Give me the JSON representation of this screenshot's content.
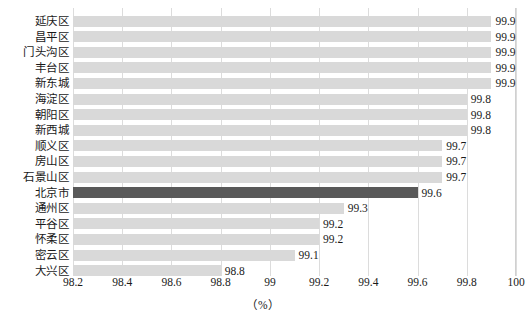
{
  "chart_data": {
    "type": "bar",
    "orientation": "horizontal",
    "title": "",
    "xlabel": "（%）",
    "ylabel": "",
    "xlim": [
      98.2,
      100
    ],
    "xticks": [
      "98.2",
      "98.4",
      "98.6",
      "98.8",
      "99",
      "99.2",
      "99.4",
      "99.6",
      "99.8",
      "100"
    ],
    "xtick_values": [
      98.2,
      98.4,
      98.6,
      98.8,
      99.0,
      99.2,
      99.4,
      99.6,
      99.8,
      100.0
    ],
    "grid": true,
    "legend": null,
    "categories": [
      "延庆区",
      "昌平区",
      "门头沟区",
      "丰台区",
      "新东城",
      "海淀区",
      "朝阳区",
      "新西城",
      "顺义区",
      "房山区",
      "石景山区",
      "北京市",
      "通州区",
      "平谷区",
      "怀柔区",
      "密云区",
      "大兴区"
    ],
    "values": [
      99.9,
      99.9,
      99.9,
      99.9,
      99.9,
      99.8,
      99.8,
      99.8,
      99.7,
      99.7,
      99.7,
      99.6,
      99.3,
      99.2,
      99.2,
      99.1,
      98.8
    ],
    "value_labels": [
      "99.9",
      "99.9",
      "99.9",
      "99.9",
      "99.9",
      "99.8",
      "99.8",
      "99.8",
      "99.7",
      "99.7",
      "99.7",
      "99.6",
      "99.3",
      "99.2",
      "99.2",
      "99.1",
      "98.8"
    ],
    "highlight_category": "北京市",
    "colors": {
      "bar": "#d9d9d9",
      "bar_highlight": "#595959",
      "gridline": "#dcdcdc",
      "axis_border": "#d0d0d0",
      "text": "#1a1a1a",
      "background": "#ffffff"
    }
  }
}
